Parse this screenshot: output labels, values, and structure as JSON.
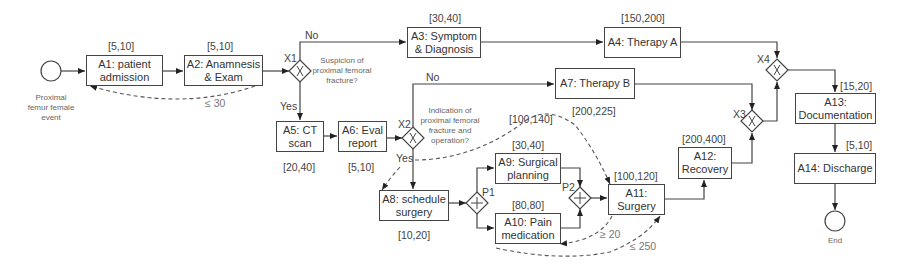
{
  "diagram": {
    "type": "process-flow",
    "start_event": {
      "label": "Proximal femur female event"
    },
    "end_event": {
      "label": "End"
    },
    "activities": [
      {
        "id": "A1",
        "label": "A1: patient admission",
        "duration": "[5,10]"
      },
      {
        "id": "A2",
        "label": "A2: Anamnesis & Exam",
        "duration": "[5,10]"
      },
      {
        "id": "A3",
        "label": "A3: Symptom & Diagnosis",
        "duration": "[30,40]"
      },
      {
        "id": "A4",
        "label": "A4: Therapy A",
        "duration": "[150,200]"
      },
      {
        "id": "A5",
        "label": "A5: CT scan",
        "duration": "[20,40]"
      },
      {
        "id": "A6",
        "label": "A6: Eval report",
        "duration": "[5,10]"
      },
      {
        "id": "A7",
        "label": "A7: Therapy B",
        "duration": "[200,225]"
      },
      {
        "id": "A8",
        "label": "A8: schedule surgery",
        "duration": "[10,20]"
      },
      {
        "id": "A9",
        "label": "A9: Surgical planning",
        "duration": "[30,40]"
      },
      {
        "id": "A10",
        "label": "A10: Pain medication",
        "duration": "[80,80]"
      },
      {
        "id": "A11",
        "label": "A11: Surgery",
        "duration": "[100,120]"
      },
      {
        "id": "A12",
        "label": "A12: Recovery",
        "duration": "[200,400]"
      },
      {
        "id": "A13",
        "label": "A13: Documentation",
        "duration": "[15,20]"
      },
      {
        "id": "A14",
        "label": "A14: Discharge",
        "duration": "[5,10]"
      }
    ],
    "gateways": [
      {
        "id": "X1",
        "label": "X1",
        "type": "xor",
        "question": "Suspicion of proximal femoral fracture?"
      },
      {
        "id": "X2",
        "label": "X2",
        "type": "xor",
        "question": "Indication of proximal femoral fracture and operation?"
      },
      {
        "id": "X3",
        "label": "X3",
        "type": "xor"
      },
      {
        "id": "X4",
        "label": "X4",
        "type": "xor"
      },
      {
        "id": "P1",
        "label": "P1",
        "type": "parallel"
      },
      {
        "id": "P2",
        "label": "P2",
        "type": "parallel"
      }
    ],
    "branch_labels": {
      "x1_no": "No",
      "x1_yes": "Yes",
      "x2_no": "No",
      "x2_yes": "Yes"
    },
    "constraints": [
      {
        "from": "A1",
        "to": "A2",
        "label": "≤ 30"
      },
      {
        "from": "A8",
        "to": "A11",
        "label": "[100,140]"
      },
      {
        "from": "A10",
        "to": "A11",
        "label": "≥ 20"
      },
      {
        "from": "A10",
        "to": "A11",
        "label": "≤ 250"
      }
    ]
  }
}
